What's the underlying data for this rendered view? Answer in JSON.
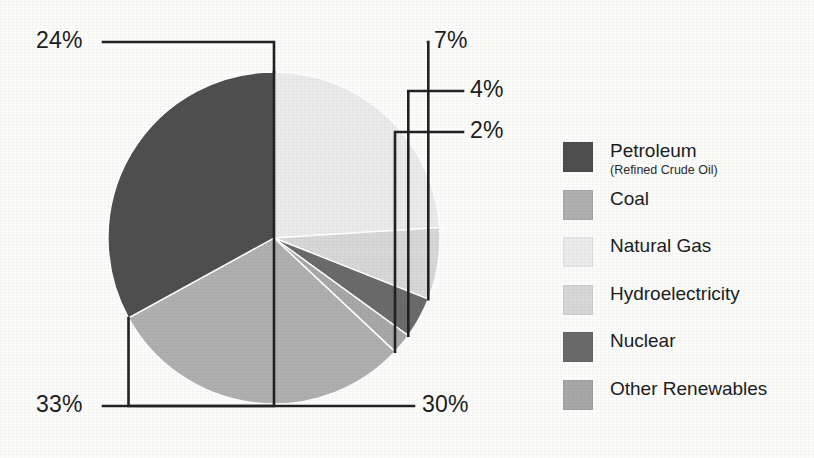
{
  "chart_data": {
    "type": "pie",
    "title": "",
    "categories": [
      "Petroleum",
      "Coal",
      "Natural Gas",
      "Hydroelectricity",
      "Nuclear",
      "Other Renewables"
    ],
    "values": [
      33,
      30,
      24,
      7,
      4,
      2
    ],
    "value_labels": [
      "33%",
      "30%",
      "24%",
      "7%",
      "4%",
      "2%"
    ],
    "units": "percent",
    "legend_position": "right",
    "grid": false,
    "slice_order_clockwise_from_top": [
      "Natural Gas",
      "Hydroelectricity",
      "Nuclear",
      "Other Renewables",
      "Coal",
      "Petroleum"
    ],
    "colors": {
      "Petroleum": "#4f4f4f",
      "Coal": "#b0b0b0",
      "Natural Gas": "#ebebeb",
      "Hydroelectricity": "#d8d8d8",
      "Nuclear": "#6b6b6b",
      "Other Renewables": "#a8a8a8"
    }
  },
  "callouts": [
    {
      "name": "natural-gas",
      "label": "24%"
    },
    {
      "name": "hydroelectricity",
      "label": "7%"
    },
    {
      "name": "nuclear",
      "label": "4%"
    },
    {
      "name": "other-renewables",
      "label": "2%"
    },
    {
      "name": "petroleum",
      "label": "33%"
    },
    {
      "name": "coal",
      "label": "30%"
    }
  ],
  "legend": {
    "items": [
      {
        "label": "Petroleum",
        "sublabel": "(Refined Crude Oil)",
        "color": "#4f4f4f"
      },
      {
        "label": "Coal",
        "sublabel": "",
        "color": "#b0b0b0"
      },
      {
        "label": "Natural Gas",
        "sublabel": "",
        "color": "#ebebeb"
      },
      {
        "label": "Hydroelectricity",
        "sublabel": "",
        "color": "#d8d8d8"
      },
      {
        "label": "Nuclear",
        "sublabel": "",
        "color": "#6b6b6b"
      },
      {
        "label": "Other Renewables",
        "sublabel": "",
        "color": "#a8a8a8"
      }
    ]
  }
}
